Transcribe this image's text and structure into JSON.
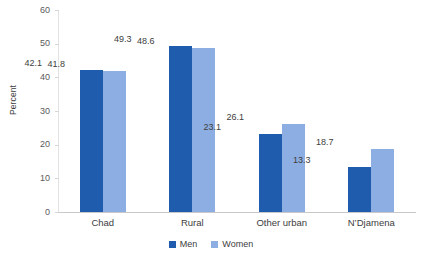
{
  "chart_data": {
    "type": "bar",
    "title": "",
    "subtitle": "",
    "xlabel": "",
    "ylabel": "Percent",
    "ylim": [
      0,
      60
    ],
    "yticks": [
      0,
      10,
      20,
      30,
      40,
      50,
      60
    ],
    "ytick_labels": [
      "0",
      "10",
      "20",
      "30",
      "40",
      "50",
      "60"
    ],
    "grid": false,
    "legend_position": "bottom-center",
    "categories": [
      "Chad",
      "Rural",
      "Other urban",
      "N’Djamena"
    ],
    "series": [
      {
        "name": "Men",
        "color": "#1f5cae",
        "values": [
          42.1,
          49.3,
          23.1,
          13.3
        ],
        "labels": [
          "42.1",
          "49.3",
          "23.1",
          "13.3"
        ]
      },
      {
        "name": "Women",
        "color": "#8daee2",
        "values": [
          41.8,
          48.6,
          26.1,
          18.7
        ],
        "labels": [
          "41.8",
          "48.6",
          "26.1",
          "18.7"
        ]
      }
    ]
  },
  "legend": {
    "items": [
      {
        "label": "Men",
        "color": "#1f5cae"
      },
      {
        "label": "Women",
        "color": "#8daee2"
      }
    ]
  },
  "colors": {
    "men": "#1f5cae",
    "women": "#8daee2",
    "axis": "#c9c9c9",
    "tick": "#d6d6d6",
    "text": "#3d3d3d",
    "background": "#ffffff"
  }
}
